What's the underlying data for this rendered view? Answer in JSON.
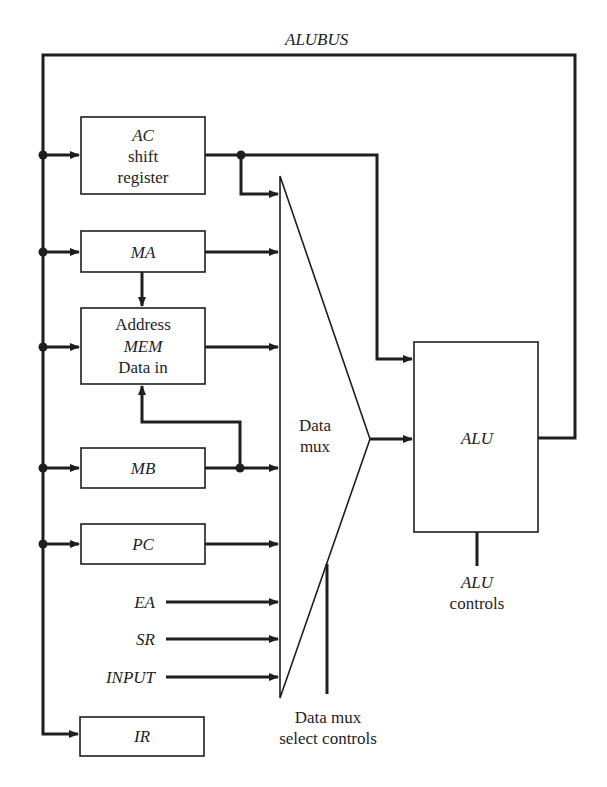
{
  "diagram": {
    "bus_label": "ALUBUS",
    "registers": {
      "ac": {
        "line1": "AC",
        "line2": "shift",
        "line3": "register"
      },
      "ma": {
        "label": "MA"
      },
      "mem": {
        "line1": "Address",
        "line2": "MEM",
        "line3": "Data in"
      },
      "mb": {
        "label": "MB"
      },
      "pc": {
        "label": "PC"
      },
      "ir": {
        "label": "IR"
      }
    },
    "inputs": {
      "ea": "EA",
      "sr": "SR",
      "input": "INPUT"
    },
    "mux": {
      "line1": "Data",
      "line2": "mux",
      "select_line1": "Data mux",
      "select_line2": "select controls"
    },
    "alu": {
      "label": "ALU",
      "controls_line1": "ALU",
      "controls_line2": "controls"
    },
    "colors": {
      "ink": "#1e1e1e",
      "background": "#ffffff"
    }
  }
}
